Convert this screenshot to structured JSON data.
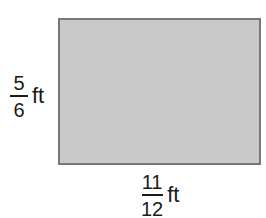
{
  "shape": {
    "type": "rectangle",
    "fill_color": "#c9c9c9",
    "border_color": "#787878"
  },
  "height_label": {
    "numerator": "5",
    "denominator": "6",
    "unit": "ft"
  },
  "width_label": {
    "numerator": "11",
    "denominator": "12",
    "unit": "ft"
  }
}
